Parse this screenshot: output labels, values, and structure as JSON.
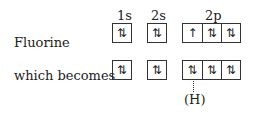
{
  "orbital_headers": [
    "1s",
    "2s",
    "2p"
  ],
  "rows": [
    {
      "label": "Fluorine",
      "orbitals": {
        "1s": [
          "⇅"
        ],
        "2s": [
          "⇅"
        ],
        "2p": [
          "↑",
          "⇅",
          "⇅"
        ]
      }
    },
    {
      "label": "which becomes",
      "orbitals": {
        "1s": [
          "⇅"
        ],
        "2s": [
          "⇅"
        ],
        "2p": [
          "⇅",
          "⇅",
          "⇅"
        ]
      }
    }
  ],
  "annotation": {
    "label": "(H)"
  }
}
